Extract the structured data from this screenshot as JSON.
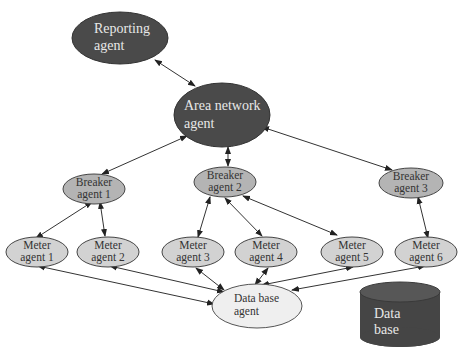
{
  "diagram": {
    "colors": {
      "dark_node": "#4a4a4a",
      "light_node": "#c8c8c8",
      "pale_node": "#efefef",
      "edge": "#333333",
      "database": "#4a4a4a"
    },
    "nodes": {
      "reporting": {
        "line1": "Reporting",
        "line2": "agent"
      },
      "area": {
        "line1": "Area network",
        "line2": "agent"
      },
      "breaker1": {
        "line1": "Breaker",
        "line2": "agent 1"
      },
      "breaker2": {
        "line1": "Breaker",
        "line2": "agent 2"
      },
      "breaker3": {
        "line1": "Breaker",
        "line2": "agent 3"
      },
      "meter1": {
        "line1": "Meter",
        "line2": "agent 1"
      },
      "meter2": {
        "line1": "Meter",
        "line2": "agent 2"
      },
      "meter3": {
        "line1": "Meter",
        "line2": "agent 3"
      },
      "meter4": {
        "line1": "Meter",
        "line2": "agent 4"
      },
      "meter5": {
        "line1": "Meter",
        "line2": "agent 5"
      },
      "meter6": {
        "line1": "Meter",
        "line2": "agent 6"
      },
      "dbagent": {
        "line1": "Data base",
        "line2": "agent"
      },
      "database": {
        "line1": "Data",
        "line2": "base"
      }
    },
    "edges": [
      {
        "from": "reporting",
        "to": "area",
        "bidirectional": true
      },
      {
        "from": "area",
        "to": "breaker1",
        "bidirectional": true
      },
      {
        "from": "area",
        "to": "breaker2",
        "bidirectional": true
      },
      {
        "from": "area",
        "to": "breaker3",
        "bidirectional": true
      },
      {
        "from": "breaker1",
        "to": "meter1",
        "bidirectional": true
      },
      {
        "from": "breaker1",
        "to": "meter2",
        "bidirectional": true
      },
      {
        "from": "breaker2",
        "to": "meter3",
        "bidirectional": true
      },
      {
        "from": "breaker2",
        "to": "meter4",
        "bidirectional": true
      },
      {
        "from": "breaker2",
        "to": "meter5",
        "bidirectional": true
      },
      {
        "from": "breaker3",
        "to": "meter6",
        "bidirectional": true
      },
      {
        "from": "meter1",
        "to": "dbagent",
        "bidirectional": true
      },
      {
        "from": "meter2",
        "to": "dbagent",
        "bidirectional": true
      },
      {
        "from": "meter3",
        "to": "dbagent",
        "bidirectional": true
      },
      {
        "from": "meter4",
        "to": "dbagent",
        "bidirectional": true
      },
      {
        "from": "meter5",
        "to": "dbagent",
        "bidirectional": true
      },
      {
        "from": "meter6",
        "to": "dbagent",
        "bidirectional": true
      }
    ]
  }
}
